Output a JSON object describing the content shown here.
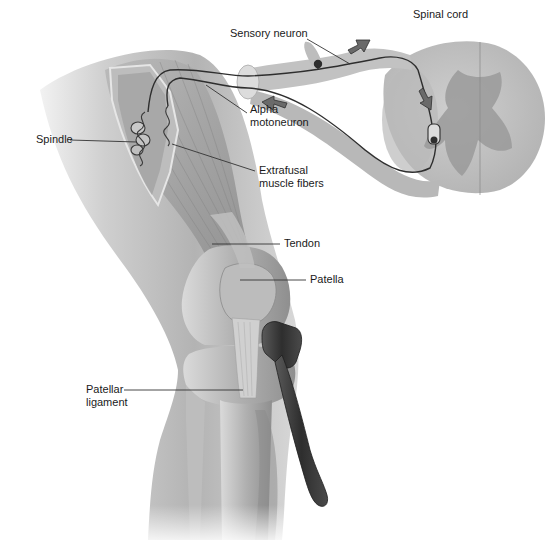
{
  "figure": {
    "colors": {
      "background": "#ffffff",
      "skin_light": "#d9d9d9",
      "skin_mid": "#b5b5b5",
      "skin_dark": "#8a8a8a",
      "muscle": "#a8a8a8",
      "bone": "#c4c4c4",
      "spinal_white_matter": "#c8c8c8",
      "spinal_gray_matter": "#9a9a9a",
      "nerve_line": "#2e2e2e",
      "hammer": "#3a3a3a",
      "arrow_fill": "#6a6a6a",
      "label_text": "#1a1a1a",
      "leader_line": "#333333"
    }
  },
  "labels": {
    "spinal_cord": "Spinal cord",
    "sensory_neuron": "Sensory neuron",
    "alpha_motoneuron_line1": "Alpha",
    "alpha_motoneuron_line2": "motoneuron",
    "spindle": "Spindle",
    "extrafusal_line1": "Extrafusal",
    "extrafusal_line2": "muscle fibers",
    "tendon": "Tendon",
    "patella": "Patella",
    "patellar_ligament_line1": "Patellar",
    "patellar_ligament_line2": "ligament"
  },
  "icons": {
    "afferent_arrow": "arrow-toward-spinal-cord",
    "efferent_arrow": "arrow-toward-muscle",
    "synapse_arrow": "arrow-down-into-ventral-horn",
    "reflex_hammer": "reflex-hammer"
  }
}
